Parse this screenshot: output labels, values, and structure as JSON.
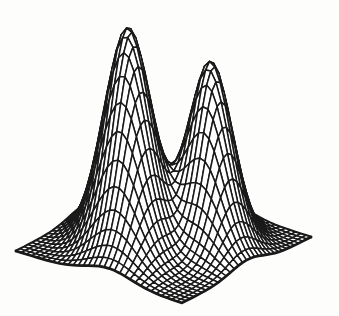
{
  "figure": {
    "type_label": "3D hidden-line wireframe surface plot",
    "background_color": "#fdfdfc",
    "ink_color": "#1a1a1a"
  },
  "chart_data": {
    "type": "surface",
    "subtype": "hidden-line wireframe mesh (painter-algorithm style)",
    "title": "",
    "xlabel": "",
    "ylabel": "",
    "zlabel": "",
    "axes_visible": false,
    "legend": null,
    "grid_divisions": 32,
    "domain": {
      "x": [
        0,
        1
      ],
      "y": [
        0,
        1
      ]
    },
    "surface_model": "sum of two anisotropic Gaussian peaks, ridges aligned with the x=y diagonal of the square base",
    "peaks": [
      {
        "name": "tall-left-peak",
        "center_x": 0.38,
        "center_y": 0.38,
        "sigma_along_diagonal": 0.115,
        "sigma_across_diagonal": 0.19,
        "peak_height_px": 218,
        "apex_screen_px": [
          130,
          28
        ]
      },
      {
        "name": "shorter-right-peak",
        "center_x": 0.66,
        "center_y": 0.66,
        "sigma_along_diagonal": 0.105,
        "sigma_across_diagonal": 0.17,
        "peak_height_px": 180,
        "apex_screen_px": [
          210,
          62
        ]
      }
    ],
    "zlim_px": [
      0,
      218
    ],
    "projection": {
      "origin_px": [
        16,
        251
      ],
      "x_edge_vector_px": [
        166,
        52
      ],
      "y_edge_vector_px": [
        129,
        -66
      ],
      "base_corners_px": {
        "left": [
          16,
          251
        ],
        "front": [
          182,
          303
        ],
        "right": [
          311,
          237
        ],
        "back": [
          145,
          185
        ]
      }
    },
    "style": {
      "line_color": "#1a1a1a",
      "line_width": 1.5,
      "border_line_width": 2.7,
      "face_fill": "#ffffff",
      "grid_on": true
    },
    "canvas": {
      "width": 339,
      "height": 316
    }
  }
}
